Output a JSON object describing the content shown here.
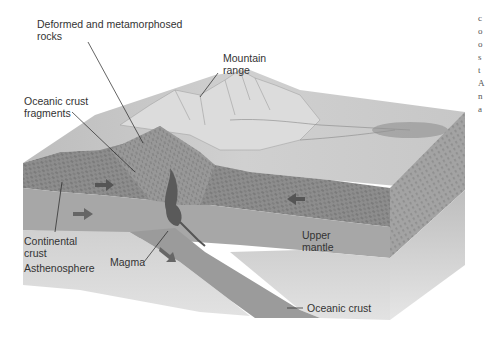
{
  "figure": {
    "labels": {
      "deformed_rocks": "Deformed and metamorphosed\nrocks",
      "deformed_rocks_line1": "Deformed and metamorphosed",
      "deformed_rocks_line2": "rocks",
      "mountain_line1": "Mountain",
      "mountain_line2": "range",
      "oceanic_fragments_line1": "Oceanic crust",
      "oceanic_fragments_line2": "fragments",
      "continental_line1": "Continental",
      "continental_line2": "crust",
      "asthenosphere": "Asthenosphere",
      "magma": "Magma",
      "upper_mantle_line1": "Upper",
      "upper_mantle_line2": "mantle",
      "oceanic_crust": "Oceanic crust"
    },
    "arrows": [
      {
        "name": "crust-arrow-right",
        "direction": "right"
      },
      {
        "name": "mantle-arrow-right",
        "direction": "right"
      },
      {
        "name": "crust-arrow-left",
        "direction": "left"
      },
      {
        "name": "subduction-arrow",
        "direction": "down-right"
      }
    ],
    "colors": {
      "surface": "#c9c9c9",
      "crust": "#8f8f8f",
      "mantle": "#a9a9a9",
      "asthenosphere": "#d6d6d6",
      "slab": "#9a9a9a",
      "side_dark": "#b5b5b5",
      "text": "#333333"
    },
    "side_column_glyphs": [
      "c",
      "o",
      "o",
      "s",
      "t",
      "A",
      "n",
      "a"
    ]
  }
}
